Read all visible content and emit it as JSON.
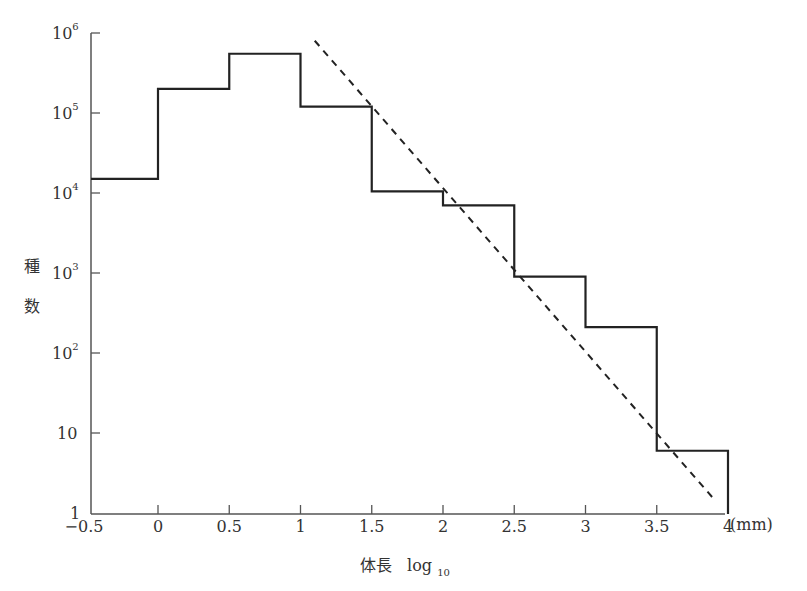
{
  "chart_data": {
    "type": "line",
    "subtype": "step-histogram-with-trend",
    "title": "",
    "xlabel": "体長 log10",
    "x_unit": "(mm)",
    "ylabel": "種数",
    "yscale": "log",
    "ylim": [
      1,
      1000000
    ],
    "xlim": [
      -0.5,
      4
    ],
    "x_ticks": [
      "−0.5",
      "0",
      "0.5",
      "1",
      "1.5",
      "2",
      "2.5",
      "3",
      "3.5",
      "4"
    ],
    "x_tick_values": [
      -0.5,
      0,
      0.5,
      1,
      1.5,
      2,
      2.5,
      3,
      3.5,
      4
    ],
    "y_ticks": [
      {
        "base": "10",
        "exp": "6",
        "value": 1000000
      },
      {
        "base": "10",
        "exp": "5",
        "value": 100000
      },
      {
        "base": "10",
        "exp": "4",
        "value": 10000
      },
      {
        "base": "10",
        "exp": "3",
        "value": 1000
      },
      {
        "base": "10",
        "exp": "2",
        "value": 100
      },
      {
        "base": "10",
        "exp": "",
        "value": 10
      },
      {
        "base": "1",
        "exp": "",
        "value": 1
      }
    ],
    "grid": false,
    "legend": null,
    "series": [
      {
        "name": "species count per size class",
        "style": "solid-step",
        "bins": [
          {
            "x_start": -0.5,
            "x_end": 0.0,
            "value": 15000
          },
          {
            "x_start": 0.0,
            "x_end": 0.5,
            "value": 200000
          },
          {
            "x_start": 0.5,
            "x_end": 1.0,
            "value": 550000
          },
          {
            "x_start": 1.0,
            "x_end": 1.5,
            "value": 120000
          },
          {
            "x_start": 1.5,
            "x_end": 2.0,
            "value": 10500
          },
          {
            "x_start": 2.0,
            "x_end": 2.5,
            "value": 7000
          },
          {
            "x_start": 2.5,
            "x_end": 3.0,
            "value": 900
          },
          {
            "x_start": 3.0,
            "x_end": 3.5,
            "value": 210
          },
          {
            "x_start": 3.5,
            "x_end": 4.0,
            "value": 6
          }
        ]
      },
      {
        "name": "trend line",
        "style": "dashed",
        "x": [
          1.1,
          3.9
        ],
        "values": [
          800000,
          1.5
        ]
      }
    ]
  },
  "labels": {
    "y_title_1": "種",
    "y_title_2": "数",
    "x_title_main": "体長",
    "x_title_log": "log",
    "x_title_sub": "10",
    "x_unit": "(mm)"
  },
  "colors": {
    "line": "#222222",
    "axis": "#555555",
    "text": "#333333"
  }
}
